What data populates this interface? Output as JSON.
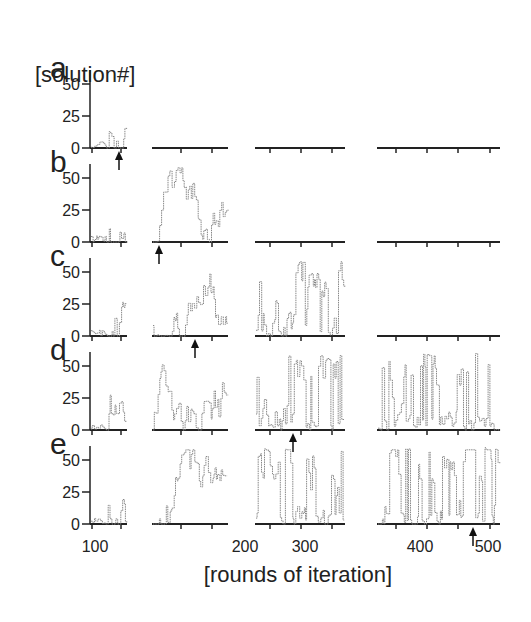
{
  "figure": {
    "row_title": "[solution#]",
    "x_title": "[rounds of iteration]",
    "row_labels": [
      "a",
      "b",
      "c",
      "d",
      "e"
    ],
    "y_ticks": [
      "0",
      "25",
      "50"
    ],
    "x_tick_labels": [
      {
        "text": "100",
        "x": 95
      },
      {
        "text": "200",
        "x": 245
      },
      {
        "text": "300",
        "x": 305
      },
      {
        "text": "400",
        "x": 420
      },
      {
        "text": "500",
        "x": 488
      }
    ],
    "colors": {
      "axis": "#222222",
      "trace": "#888888",
      "trace_dark": "#555555",
      "arrow": "#111111"
    }
  },
  "chart_data": {
    "type": "line",
    "title": "",
    "xlabel": "[rounds of iteration]",
    "ylabel": "[solution#]",
    "ylim": [
      0,
      60
    ],
    "y_ticks": [
      0,
      25,
      50
    ],
    "x_ticks_labeled": [
      100,
      200,
      300,
      400,
      500
    ],
    "grid": false,
    "legend": null,
    "panels_per_row": 4,
    "panel_x_ranges": [
      [
        0,
        60
      ],
      [
        60,
        180
      ],
      [
        180,
        320
      ],
      [
        330,
        520
      ]
    ],
    "rows": [
      {
        "label": "a",
        "active_panels": 1,
        "arrow_at_round": 45
      },
      {
        "label": "b",
        "active_panels": 2,
        "arrow_at_round": 65
      },
      {
        "label": "c",
        "active_panels": 3,
        "arrow_at_round": 125
      },
      {
        "label": "d",
        "active_panels": 4,
        "arrow_at_round": 245
      },
      {
        "label": "e",
        "active_panels": 4,
        "arrow_at_round": 485
      }
    ],
    "series_description": "Each row shows the solution index (0-60) selected at each iteration round; rows progressively extend the run (a stops ~round 50, b ~170, c ~320, d/e ~520). Arrow marks where the run was terminated/converged."
  }
}
